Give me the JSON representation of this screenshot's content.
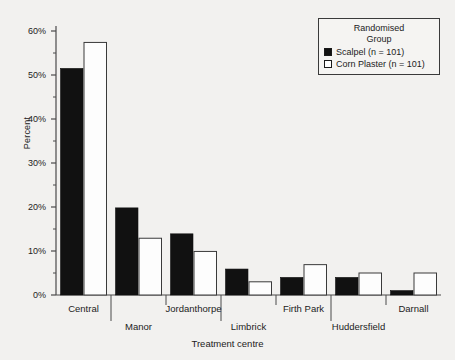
{
  "chart_data": {
    "type": "bar",
    "title": "",
    "xlabel": "Treatment centre",
    "ylabel": "Percent",
    "categories": [
      "Central",
      "Manor",
      "Jordanthorpe",
      "Limbrick",
      "Firth Park",
      "Huddersfield",
      "Darnall"
    ],
    "series": [
      {
        "name": "Scalpel (n = 101)",
        "values": [
          51.5,
          19.8,
          13.9,
          5.9,
          4.0,
          4.0,
          1.0
        ],
        "color": "#111111",
        "style": "filled"
      },
      {
        "name": "Corn Plaster (n = 101)",
        "values": [
          57.4,
          12.9,
          9.9,
          3.0,
          6.9,
          5.0,
          5.0
        ],
        "color": "#ffffff",
        "style": "hollow"
      }
    ],
    "ylim": [
      0,
      60
    ],
    "yticks": [
      0,
      10,
      20,
      30,
      40,
      50,
      60
    ],
    "ytick_labels": [
      "0%",
      "10%",
      "20%",
      "30%",
      "40%",
      "50%",
      "60%"
    ],
    "yminor_ticks": [
      5,
      15,
      25,
      35,
      45,
      55
    ],
    "grid": false,
    "legend_position": "top-right",
    "legend_title_lines": [
      "Randomised",
      "Group"
    ]
  },
  "colors": {
    "background": "#f2f1ef",
    "axis": "#4a4a4a",
    "text": "#222222",
    "scalpel": "#111111",
    "corn_plaster": "#fdfdfd"
  }
}
